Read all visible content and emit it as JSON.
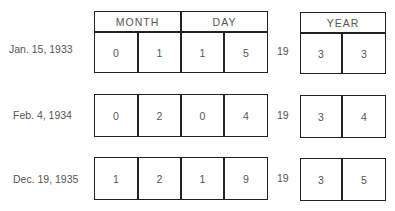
{
  "headers": {
    "month": "MONTH",
    "day": "DAY",
    "year": "YEAR"
  },
  "century_prefix": "19",
  "rows": [
    {
      "label": "Jan. 15, 1933",
      "digits": [
        "0",
        "1",
        "1",
        "5"
      ],
      "year": [
        "3",
        "3"
      ]
    },
    {
      "label": "Feb. 4, 1934",
      "digits": [
        "0",
        "2",
        "0",
        "4"
      ],
      "year": [
        "3",
        "4"
      ]
    },
    {
      "label": "Dec. 19, 1935",
      "digits": [
        "1",
        "2",
        "1",
        "9"
      ],
      "year": [
        "3",
        "5"
      ]
    }
  ]
}
